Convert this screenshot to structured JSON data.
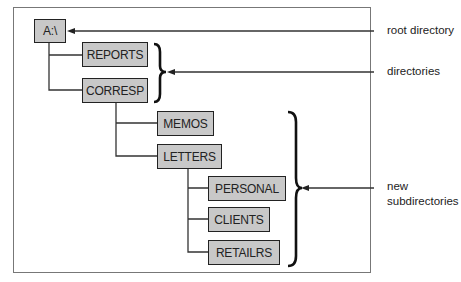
{
  "diagram": {
    "nodes": [
      {
        "id": "root",
        "label": "A:\\"
      },
      {
        "id": "reports",
        "label": "REPORTS"
      },
      {
        "id": "corresp",
        "label": "CORRESP"
      },
      {
        "id": "memos",
        "label": "MEMOS"
      },
      {
        "id": "letters",
        "label": "LETTERS"
      },
      {
        "id": "personal",
        "label": "PERSONAL"
      },
      {
        "id": "clients",
        "label": "CLIENTS"
      },
      {
        "id": "retailrs",
        "label": "RETAILRS"
      }
    ],
    "edges": [
      [
        "root",
        "reports"
      ],
      [
        "root",
        "corresp"
      ],
      [
        "corresp",
        "memos"
      ],
      [
        "corresp",
        "letters"
      ],
      [
        "letters",
        "personal"
      ],
      [
        "letters",
        "clients"
      ],
      [
        "letters",
        "retailrs"
      ]
    ],
    "annotations": {
      "root": "root directory",
      "dirs": "directories",
      "new_line1": "new",
      "new_line2": "subdirectories"
    },
    "colors": {
      "box_fill": "#c8c8c8",
      "stroke": "#222222"
    }
  }
}
